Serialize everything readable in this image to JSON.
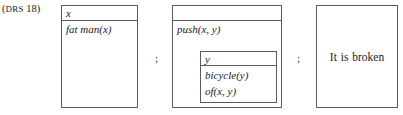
{
  "figure": {
    "label_open_paren": "(",
    "label_smallcaps": "DRS",
    "label_number": " 18)",
    "border_color": "#5a5a5a",
    "background_color": "#ffffff",
    "text_color": "#1a1a1a"
  },
  "boxes": [
    {
      "id": "fat-man-drs",
      "universe": "x",
      "conditions": [
        "fat man(x)"
      ]
    },
    {
      "id": "push-drs",
      "universe": "",
      "conditions": [
        "push(x, y)"
      ],
      "nested": {
        "id": "bicycle-drs",
        "universe": "y",
        "conditions": [
          "bicycle(y)",
          "of(x, y)"
        ]
      }
    },
    {
      "id": "broken-drs",
      "text": "It is broken"
    }
  ],
  "separators": [
    {
      "symbol": ";"
    },
    {
      "symbol": ";"
    }
  ]
}
